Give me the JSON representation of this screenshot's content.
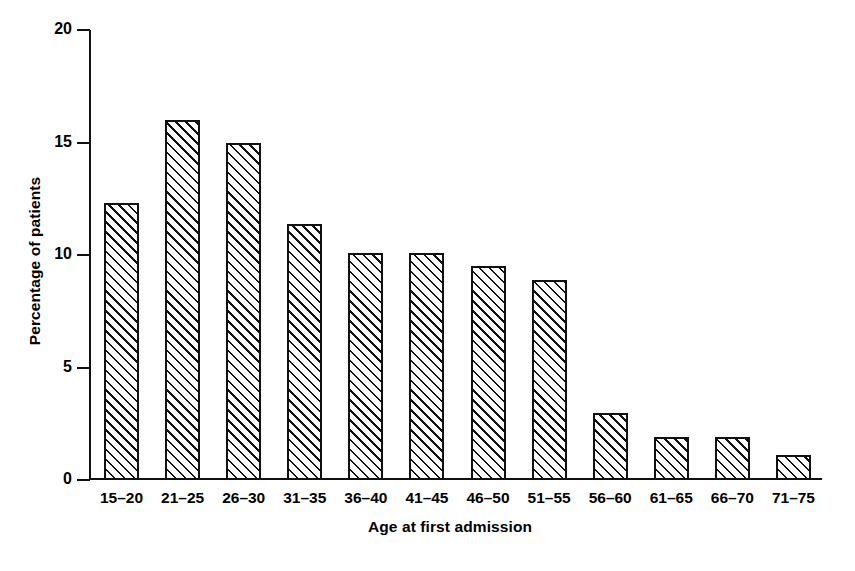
{
  "chart_data": {
    "type": "bar",
    "title": "",
    "subtitle": "",
    "xlabel": "Age at first admission",
    "ylabel": "Percentage of patients",
    "categories": [
      "15–20",
      "21–25",
      "26–30",
      "31–35",
      "36–40",
      "41–45",
      "46–50",
      "51–55",
      "56–60",
      "61–65",
      "66–70",
      "71–75"
    ],
    "values": [
      12.3,
      16.0,
      15.0,
      11.4,
      10.1,
      10.1,
      9.5,
      8.9,
      3.0,
      1.9,
      1.9,
      1.1
    ],
    "ylim": [
      0,
      20
    ],
    "xlim_note": "categorical",
    "ytick_labels": [
      "0",
      "5",
      "10",
      "15",
      "20"
    ],
    "ytick_values": [
      0,
      5,
      10,
      15,
      20
    ],
    "grid": false,
    "legend": false,
    "legend_position": "none",
    "bar_fill": "hatched-diagonal",
    "colors": {
      "line": "#111111",
      "background": "#ffffff",
      "bar_fill": "#ffffff",
      "hatch": "#111111"
    }
  },
  "axes": {
    "y_title": "Percentage of patients",
    "x_title": "Age at first admission"
  }
}
